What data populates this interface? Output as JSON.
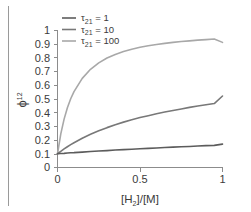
{
  "chart_data": {
    "type": "line",
    "title": "",
    "xlabel": "[H2]/[M]",
    "xlabel_parts": {
      "pre": "[H",
      "sub": "2",
      "post": "]/[M]"
    },
    "ylabel": "phi^12",
    "ylabel_parts": {
      "symbol": "ϕ",
      "sup": "12"
    },
    "xlim": [
      0,
      1
    ],
    "ylim": [
      0,
      1
    ],
    "xticks": [
      "0",
      "0.5",
      "1"
    ],
    "xtick_values": [
      0,
      0.5,
      1
    ],
    "yticks": [
      "0",
      "0.1",
      "0.2",
      "0.3",
      "0.4",
      "0.5",
      "0.6",
      "0.7",
      "0.8",
      "0.9",
      "1"
    ],
    "ytick_values": [
      0,
      0.1,
      0.2,
      0.3,
      0.4,
      0.5,
      0.6,
      0.7,
      0.8,
      0.9,
      1.0
    ],
    "grid": false,
    "legend_position": "top-left-inside",
    "x": [
      0,
      0.02,
      0.04,
      0.06,
      0.08,
      0.1,
      0.15,
      0.2,
      0.25,
      0.3,
      0.35,
      0.4,
      0.45,
      0.5,
      0.55,
      0.6,
      0.65,
      0.7,
      0.75,
      0.8,
      0.85,
      0.9,
      0.95,
      1.0
    ],
    "series": [
      {
        "name": "tau21 = 1",
        "label_parts": {
          "symbol": "τ",
          "sub": "21",
          "eq": " = ",
          "value": "1"
        },
        "tau": 1,
        "color": "#5c5c5c",
        "values": [
          0.1,
          0.102,
          0.103,
          0.105,
          0.107,
          0.108,
          0.112,
          0.116,
          0.12,
          0.123,
          0.127,
          0.13,
          0.133,
          0.136,
          0.139,
          0.142,
          0.145,
          0.148,
          0.151,
          0.153,
          0.156,
          0.159,
          0.161,
          0.17
        ]
      },
      {
        "name": "tau21 = 10",
        "label_parts": {
          "symbol": "τ",
          "sub": "21",
          "eq": " = ",
          "value": "10"
        },
        "tau": 10,
        "color": "#787878",
        "values": [
          0.1,
          0.118,
          0.135,
          0.151,
          0.166,
          0.18,
          0.213,
          0.242,
          0.267,
          0.29,
          0.311,
          0.33,
          0.347,
          0.363,
          0.377,
          0.391,
          0.403,
          0.415,
          0.426,
          0.437,
          0.447,
          0.456,
          0.465,
          0.52
        ]
      },
      {
        "name": "tau21 = 100",
        "label_parts": {
          "symbol": "τ",
          "sub": "21",
          "eq": " = ",
          "value": "100"
        },
        "tau": 100,
        "color": "#a8a8a8",
        "values": [
          0.1,
          0.244,
          0.352,
          0.435,
          0.5,
          0.552,
          0.648,
          0.714,
          0.761,
          0.796,
          0.822,
          0.843,
          0.86,
          0.874,
          0.885,
          0.895,
          0.903,
          0.91,
          0.916,
          0.921,
          0.926,
          0.93,
          0.934,
          0.91
        ]
      }
    ]
  },
  "axes": {
    "y_tick_labels": [
      "1",
      "0.9",
      "0.8",
      "0.7",
      "0.6",
      "0.5",
      "0.4",
      "0.3",
      "0.2",
      "0.1",
      "0"
    ],
    "x_tick_labels": [
      "0",
      "0.5",
      "1"
    ]
  },
  "colors": {
    "axis": "#8c8c8c",
    "text": "#3b3b3b",
    "rule": "#9a9a9a",
    "background": "#ffffff"
  }
}
